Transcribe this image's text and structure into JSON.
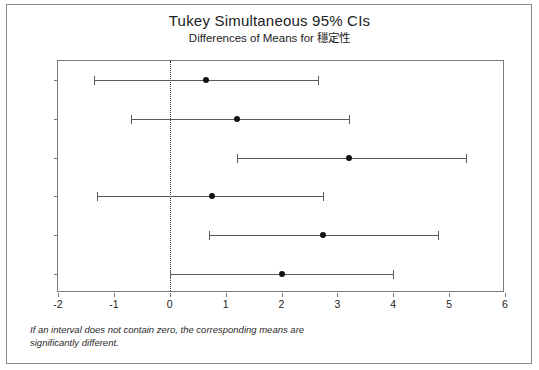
{
  "chart_data": {
    "type": "scatter",
    "title": "Tukey Simultaneous 95% CIs",
    "subtitle": "Differences of Means for 穩定性",
    "xlabel": "",
    "ylabel": "",
    "xlim": [
      -2,
      6
    ],
    "xticks": [
      -2,
      -1,
      0,
      1,
      2,
      3,
      4,
      5,
      6
    ],
    "xtick_labels": [
      "-2",
      "-1",
      "0",
      "1",
      "2",
      "3",
      "4",
      "5",
      "6"
    ],
    "categories": [
      "2 - 1",
      "3 - 1",
      "4 - 1",
      "3 - 2",
      "4 - 2",
      "4 - 3"
    ],
    "grid": false,
    "legend": null,
    "reference_line": {
      "value": 0,
      "style": "dotted",
      "color": "#3a3a3a"
    },
    "series": [
      {
        "name": "Tukey 95% confidence interval",
        "marker": "filled-circle",
        "color": "#111111",
        "points": [
          {
            "category": "2 - 1",
            "center": 0.65,
            "lower": -1.35,
            "upper": 2.65
          },
          {
            "category": "3 - 1",
            "center": 1.2,
            "lower": -0.7,
            "upper": 3.2
          },
          {
            "category": "4 - 1",
            "center": 3.2,
            "lower": 1.2,
            "upper": 5.3
          },
          {
            "category": "3 - 2",
            "center": 0.75,
            "lower": -1.3,
            "upper": 2.75
          },
          {
            "category": "4 - 2",
            "center": 2.75,
            "lower": 0.7,
            "upper": 4.8
          },
          {
            "category": "4 - 3",
            "center": 2.0,
            "lower": 0.0,
            "upper": 4.0
          }
        ]
      }
    ],
    "footnote_lines": [
      "If an interval does not contain zero, the corresponding means are",
      "significantly different."
    ]
  },
  "colors": {
    "marker": "#111111",
    "interval": "#5a5a5a",
    "frame": "#7a7a7a",
    "reference": "#3a3a3a",
    "background": "#ffffff"
  }
}
